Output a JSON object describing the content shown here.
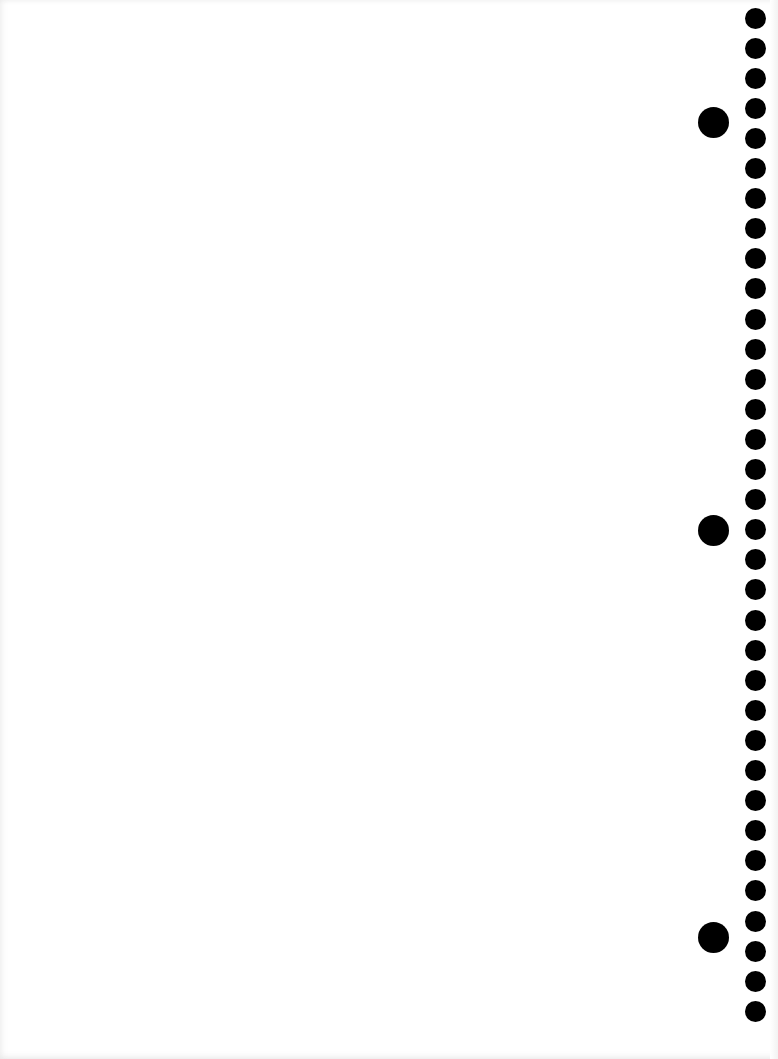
{
  "page": {
    "type": "blank notebook sheet",
    "background_color": "#ffffff",
    "hole_color": "#000000"
  },
  "binding": {
    "small_holes": {
      "count": 34,
      "center_x": 755,
      "first_center_y": 18,
      "spacing_y": 30.1,
      "diameter": 21
    },
    "large_holes": [
      {
        "center_x": 713,
        "center_y": 122,
        "diameter": 31
      },
      {
        "center_x": 713,
        "center_y": 530,
        "diameter": 31
      },
      {
        "center_x": 713,
        "center_y": 937,
        "diameter": 31
      }
    ]
  }
}
